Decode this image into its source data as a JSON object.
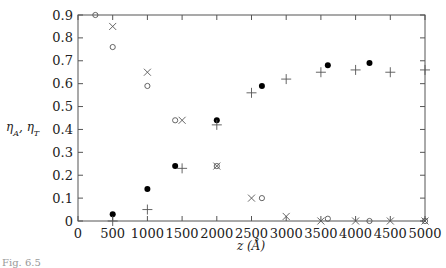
{
  "chart_data": {
    "type": "scatter",
    "title": "",
    "xlabel": "z (Å)",
    "ylabel": "η_A, η_T",
    "xlim": [
      0,
      5000
    ],
    "ylim": [
      0,
      0.9
    ],
    "x_ticks": [
      0,
      500,
      1000,
      1500,
      2000,
      2500,
      3000,
      3500,
      4000,
      4500,
      5000
    ],
    "y_ticks": [
      0,
      0.1,
      0.2,
      0.3,
      0.4,
      0.5,
      0.6,
      0.7,
      0.8,
      0.9
    ],
    "grid": false,
    "legend": null,
    "series": [
      {
        "name": "open-circle",
        "marker": "o",
        "x": [
          250,
          500,
          1000,
          1400,
          2000,
          2650,
          3600,
          4200,
          5000
        ],
        "y": [
          0.9,
          0.76,
          0.59,
          0.44,
          0.24,
          0.1,
          0.01,
          0.0,
          0.0
        ]
      },
      {
        "name": "cross",
        "marker": "x",
        "x": [
          500,
          1000,
          1500,
          2000,
          2500,
          3000,
          3500,
          4000,
          4500,
          5000
        ],
        "y": [
          0.85,
          0.65,
          0.44,
          0.24,
          0.1,
          0.02,
          0.0,
          0.0,
          0.0,
          0.0
        ]
      },
      {
        "name": "filled-circle",
        "marker": "●",
        "x": [
          500,
          1000,
          1400,
          2000,
          2650,
          3600,
          4200
        ],
        "y": [
          0.03,
          0.14,
          0.24,
          0.44,
          0.59,
          0.68,
          0.69
        ]
      },
      {
        "name": "plus",
        "marker": "+",
        "x": [
          500,
          1000,
          1500,
          2000,
          2500,
          3000,
          3500,
          4000,
          4500,
          5000
        ],
        "y": [
          0.0,
          0.05,
          0.23,
          0.42,
          0.56,
          0.62,
          0.65,
          0.66,
          0.65,
          0.66
        ]
      }
    ]
  },
  "labels": {
    "xlabel": "z (Å)",
    "ylabel": "η_A, η_T",
    "caption": "Fig. 6.5"
  }
}
